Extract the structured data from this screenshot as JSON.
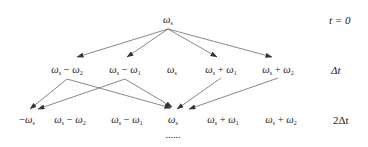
{
  "diagram": {
    "type": "frequency-tree",
    "levels": [
      {
        "time_label": "t = 0",
        "nodes": [
          {
            "id": "r0n0",
            "text": "ωs",
            "x": 168,
            "y": 20
          }
        ]
      },
      {
        "time_label": "Δt",
        "nodes": [
          {
            "id": "r1n0",
            "text": "ωs − ω2",
            "x": 67,
            "y": 64
          },
          {
            "id": "r1n1",
            "text": "ωs − ω1",
            "x": 125,
            "y": 64
          },
          {
            "id": "r1n2",
            "text": "ωs",
            "x": 172,
            "y": 64
          },
          {
            "id": "r1n3",
            "text": "ωs + ω1",
            "x": 221,
            "y": 64
          },
          {
            "id": "r1n4",
            "text": "ωs + ω2",
            "x": 278,
            "y": 64
          }
        ]
      },
      {
        "time_label": "2Δt",
        "nodes": [
          {
            "id": "r2n0",
            "text": "−ωs",
            "x": 27,
            "y": 114
          },
          {
            "id": "r2n1",
            "text": "ωs − ω2",
            "x": 70,
            "y": 114
          },
          {
            "id": "r2n2",
            "text": "ωs − ω1",
            "x": 127,
            "y": 114
          },
          {
            "id": "r2n3",
            "text": "ωs",
            "x": 173,
            "y": 114
          },
          {
            "id": "r2n4",
            "text": "ωs + ω1",
            "x": 223,
            "y": 114
          },
          {
            "id": "r2n5",
            "text": "ωs + ω2",
            "x": 281,
            "y": 114
          }
        ]
      }
    ],
    "continuation": "......",
    "edges": [
      [
        "r0n0",
        "r1n0"
      ],
      [
        "r0n0",
        "r1n1"
      ],
      [
        "r0n0",
        "r1n3"
      ],
      [
        "r0n0",
        "r1n4"
      ],
      [
        "r1n0",
        "r2n0"
      ],
      [
        "r1n0",
        "r2n3"
      ],
      [
        "r1n1",
        "r2n0"
      ],
      [
        "r1n1",
        "r2n3"
      ],
      [
        "r1n3",
        "r2n3"
      ],
      [
        "r1n4",
        "r2n3"
      ]
    ],
    "line_color": "#444444"
  }
}
